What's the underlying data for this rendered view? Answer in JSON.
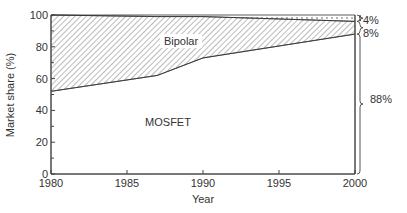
{
  "chart_data": {
    "type": "area",
    "title": "",
    "xlabel": "Year",
    "ylabel": "Market share (%)",
    "xlim": [
      1980,
      2000
    ],
    "ylim": [
      0,
      100
    ],
    "x_ticks": [
      "1980",
      "1985",
      "1990",
      "1995",
      "2000"
    ],
    "y_ticks": [
      "0",
      "20",
      "40",
      "60",
      "80",
      "100"
    ],
    "stacked": true,
    "x": [
      1980,
      1987,
      1990,
      2000
    ],
    "series": [
      {
        "name": "MOSFET",
        "values": [
          52,
          62,
          73,
          88
        ],
        "pattern": "blank"
      },
      {
        "name": "Bipolar",
        "values": [
          48,
          37,
          26,
          8
        ],
        "pattern": "hatched"
      },
      {
        "name": "Other",
        "values": [
          0,
          1,
          1,
          4
        ],
        "pattern": "dotted"
      }
    ],
    "annotations": [
      {
        "label": "4%",
        "year": 2000,
        "segment": "Other"
      },
      {
        "label": "8%",
        "year": 2000,
        "segment": "Bipolar"
      },
      {
        "label": "88%",
        "year": 2000,
        "segment": "MOSFET"
      }
    ],
    "region_labels": [
      "Bipolar",
      "MOSFET"
    ],
    "grid": false,
    "legend": "none"
  }
}
